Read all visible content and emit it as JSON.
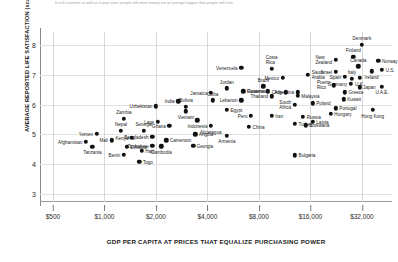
{
  "subtitle": "In rich countries as well as in poor ones, people with more money are on average happier than people with less",
  "chart_data": {
    "type": "scatter",
    "title": "",
    "xlabel": "GDP  PER CAPITA AT PRICES THAT EQUALIZE PURCHASING POWER",
    "ylabel": "AVERAGE REPORTED LIFE SATISFACTION (scale 0 - 10)",
    "x_scale": "log",
    "xticks": [
      "$500",
      "$1,000",
      "$2,000",
      "$4,000",
      "$8,000",
      "$16,000",
      "$32,000"
    ],
    "xtick_values": [
      500,
      1000,
      2000,
      4000,
      8000,
      16000,
      32000
    ],
    "yticks": [
      "3",
      "4",
      "5",
      "6",
      "7",
      "8"
    ],
    "ytick_values": [
      3,
      4,
      5,
      6,
      7,
      8
    ],
    "xlim": [
      420,
      48000
    ],
    "ylim": [
      2.72,
      8.45
    ],
    "grid": "both",
    "legend": "none",
    "marker_color": "#111111",
    "points": [
      {
        "label": "Denmark",
        "x": 32000,
        "y": 8.02,
        "lp": "top"
      },
      {
        "label": "New\nZealand",
        "x": 22500,
        "y": 7.52,
        "lp": "lft"
      },
      {
        "label": "Finland",
        "x": 28500,
        "y": 7.62,
        "lp": "top"
      },
      {
        "label": "Norway",
        "x": 40000,
        "y": 7.48,
        "lp": "rgt"
      },
      {
        "label": "Canada",
        "x": 30500,
        "y": 7.3,
        "lp": "top"
      },
      {
        "label": "Ireland",
        "x": 36500,
        "y": 7.12,
        "lp": "bot"
      },
      {
        "label": "U.S.",
        "x": 42000,
        "y": 7.18,
        "lp": "rgt"
      },
      {
        "label": "Israel",
        "x": 22500,
        "y": 7.1,
        "lp": "lft"
      },
      {
        "label": "Spain",
        "x": 25500,
        "y": 6.95,
        "lp": "lft"
      },
      {
        "label": "U.K.",
        "x": 31000,
        "y": 6.9,
        "lp": "bot"
      },
      {
        "label": "Italy",
        "x": 28000,
        "y": 6.88,
        "lp": "top"
      },
      {
        "label": "Germany",
        "x": 27500,
        "y": 6.7,
        "lp": "lft"
      },
      {
        "label": "Japan",
        "x": 31000,
        "y": 6.58,
        "lp": "rgt"
      },
      {
        "label": "U.A.E.",
        "x": 42000,
        "y": 6.6,
        "lp": "bot"
      },
      {
        "label": "Saudi\nArabia",
        "x": 15500,
        "y": 7.0,
        "lp": "rgt"
      },
      {
        "label": "Costa\nRica",
        "x": 9500,
        "y": 7.2,
        "lp": "top"
      },
      {
        "label": "Venezuela",
        "x": 6300,
        "y": 7.25,
        "lp": "lft"
      },
      {
        "label": "Mexico",
        "x": 11000,
        "y": 6.9,
        "lp": "lft"
      },
      {
        "label": "Brazil",
        "x": 8500,
        "y": 6.62,
        "lp": "top"
      },
      {
        "label": "Argentina",
        "x": 13500,
        "y": 6.42,
        "lp": "lft"
      },
      {
        "label": "Chile",
        "x": 11500,
        "y": 6.42,
        "lp": "lft"
      },
      {
        "label": "Panama",
        "x": 9000,
        "y": 6.45,
        "lp": "lft"
      },
      {
        "label": "Puerto\nRico",
        "x": 22000,
        "y": 6.65,
        "lp": "lft"
      },
      {
        "label": "Greece",
        "x": 25500,
        "y": 6.42,
        "lp": "rgt"
      },
      {
        "label": "Kuwait",
        "x": 25000,
        "y": 6.18,
        "lp": "rgt"
      },
      {
        "label": "Portugal",
        "x": 22500,
        "y": 5.88,
        "lp": "rgt"
      },
      {
        "label": "Hungary",
        "x": 21000,
        "y": 5.7,
        "lp": "rgt"
      },
      {
        "label": "Hong Kong",
        "x": 37000,
        "y": 5.82,
        "lp": "bot"
      },
      {
        "label": "Latvia",
        "x": 16500,
        "y": 5.42,
        "lp": "rgt"
      },
      {
        "label": "Poland",
        "x": 16500,
        "y": 6.05,
        "lp": "rgt"
      },
      {
        "label": "South\nAfrica",
        "x": 13000,
        "y": 6.0,
        "lp": "lft"
      },
      {
        "label": "Malaysia",
        "x": 13500,
        "y": 6.3,
        "lp": "rgt"
      },
      {
        "label": "Russia",
        "x": 14500,
        "y": 5.6,
        "lp": "rgt"
      },
      {
        "label": "Turkey",
        "x": 13000,
        "y": 5.35,
        "lp": "rgt"
      },
      {
        "label": "Botswana",
        "x": 15000,
        "y": 5.3,
        "lp": "rgt"
      },
      {
        "label": "Bulgaria",
        "x": 13000,
        "y": 4.3,
        "lp": "rgt"
      },
      {
        "label": "Thailand",
        "x": 9500,
        "y": 6.28,
        "lp": "lft"
      },
      {
        "label": "Guatemala",
        "x": 6500,
        "y": 6.45,
        "lp": "rgt"
      },
      {
        "label": "Jordan",
        "x": 5200,
        "y": 6.55,
        "lp": "top"
      },
      {
        "label": "Jamaica",
        "x": 4200,
        "y": 6.4,
        "lp": "lft"
      },
      {
        "label": "Lebanon",
        "x": 6300,
        "y": 6.15,
        "lp": "lft"
      },
      {
        "label": "Cuba",
        "x": 4300,
        "y": 6.15,
        "lp": "top"
      },
      {
        "label": "India",
        "x": 2700,
        "y": 6.12,
        "lp": "lft"
      },
      {
        "label": "Bolivia",
        "x": 3000,
        "y": 5.92,
        "lp": "top"
      },
      {
        "label": "Uzbekistan",
        "x": 2000,
        "y": 5.95,
        "lp": "lft"
      },
      {
        "label": "Vietnam",
        "x": 3000,
        "y": 5.78,
        "lp": "bot"
      },
      {
        "label": "Egypt",
        "x": 5200,
        "y": 5.82,
        "lp": "rgt"
      },
      {
        "label": "Peru",
        "x": 7200,
        "y": 5.62,
        "lp": "lft"
      },
      {
        "label": "Iran",
        "x": 9500,
        "y": 5.62,
        "lp": "rgt"
      },
      {
        "label": "Indonesia",
        "x": 3500,
        "y": 5.48,
        "lp": "bot"
      },
      {
        "label": "Nicaragua",
        "x": 4200,
        "y": 5.28,
        "lp": "bot"
      },
      {
        "label": "China",
        "x": 7000,
        "y": 5.25,
        "lp": "rgt"
      },
      {
        "label": "Armenia",
        "x": 5200,
        "y": 4.95,
        "lp": "bot"
      },
      {
        "label": "Ghana",
        "x": 2400,
        "y": 5.28,
        "lp": "lft"
      },
      {
        "label": "Angola",
        "x": 3400,
        "y": 5.0,
        "lp": "rgt"
      },
      {
        "label": "Cameroon",
        "x": 2300,
        "y": 4.8,
        "lp": "rgt"
      },
      {
        "label": "Zimbabwe",
        "x": 1900,
        "y": 4.62,
        "lp": "lft"
      },
      {
        "label": "Cambodia",
        "x": 2150,
        "y": 4.6,
        "lp": "bot"
      },
      {
        "label": "Georgia",
        "x": 3300,
        "y": 4.62,
        "lp": "rgt"
      },
      {
        "label": "Zambia",
        "x": 1300,
        "y": 5.52,
        "lp": "top"
      },
      {
        "label": "Nepal",
        "x": 1250,
        "y": 5.12,
        "lp": "top"
      },
      {
        "label": "Senegal",
        "x": 1700,
        "y": 5.12,
        "lp": "top"
      },
      {
        "label": "Laos",
        "x": 2050,
        "y": 5.42,
        "lp": "lft"
      },
      {
        "label": "Bangladesh",
        "x": 1900,
        "y": 4.92,
        "lp": "lft"
      },
      {
        "label": "Yemen",
        "x": 900,
        "y": 5.02,
        "lp": "lft"
      },
      {
        "label": "Kenya",
        "x": 1450,
        "y": 4.88,
        "lp": "lft"
      },
      {
        "label": "Mali",
        "x": 1100,
        "y": 4.8,
        "lp": "lft"
      },
      {
        "label": "Afghanistan",
        "x": 780,
        "y": 4.75,
        "lp": "lft"
      },
      {
        "label": "Tanzania",
        "x": 850,
        "y": 4.58,
        "lp": "bot"
      },
      {
        "label": "Ethiopia",
        "x": 1350,
        "y": 4.58,
        "lp": "rgt"
      },
      {
        "label": "Haiti",
        "x": 1650,
        "y": 4.45,
        "lp": "rgt"
      },
      {
        "label": "Benin",
        "x": 1300,
        "y": 4.32,
        "lp": "lft"
      },
      {
        "label": "Togo",
        "x": 1600,
        "y": 4.08,
        "lp": "rgt"
      }
    ]
  }
}
